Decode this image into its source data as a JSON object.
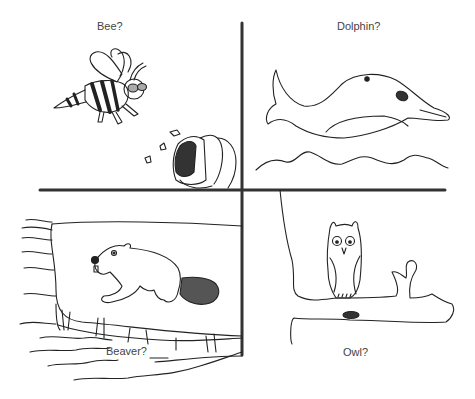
{
  "figure": {
    "quadrants": [
      {
        "id": "top-left",
        "label": "Bee?",
        "subject": "bee flying near beehive"
      },
      {
        "id": "top-right",
        "label": "Dolphin?",
        "subject": "dolphin over waves"
      },
      {
        "id": "bottom-left",
        "label": "Beaver?",
        "subject": "beaver inside lodge by water"
      },
      {
        "id": "bottom-right",
        "label": "Owl?",
        "subject": "owl perched on tree branch"
      }
    ],
    "colors": {
      "line": "#222222",
      "divider": "#333333",
      "fill_dark": "#333333",
      "fill_gray": "#555555",
      "eye_gray": "#aaaaaa"
    }
  }
}
